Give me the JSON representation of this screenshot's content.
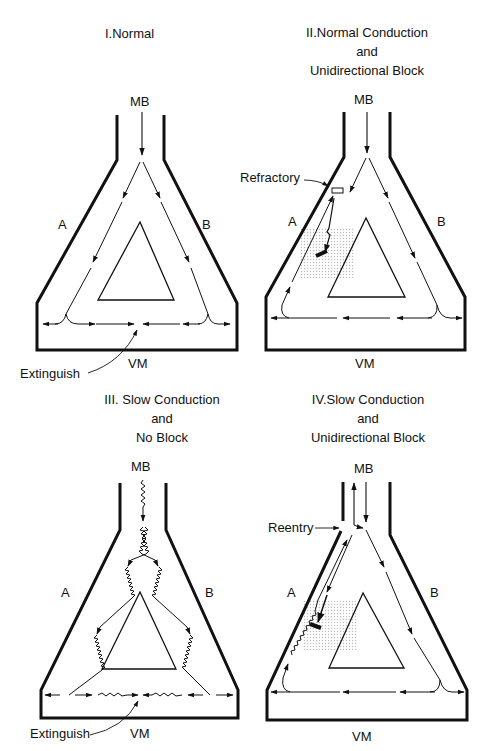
{
  "panels": [
    {
      "id": "I",
      "title_lines": [
        "I.Normal"
      ],
      "labels": {
        "top": "MB",
        "left": "A",
        "right": "B",
        "bottom": "VM",
        "annotation": "Extinguish"
      }
    },
    {
      "id": "II",
      "title_lines": [
        "II.Normal Conduction",
        "and",
        "Unidirectional Block"
      ],
      "labels": {
        "top": "MB",
        "left": "A",
        "right": "B",
        "bottom": "VM",
        "annotation": "Refractory"
      }
    },
    {
      "id": "III",
      "title_lines": [
        "III. Slow Conduction",
        "and",
        "No Block"
      ],
      "labels": {
        "top": "MB",
        "left": "A",
        "right": "B",
        "bottom": "VM",
        "annotation": "Extinguish"
      }
    },
    {
      "id": "IV",
      "title_lines": [
        "IV.Slow Conduction",
        "and",
        "Unidirectional Block"
      ],
      "labels": {
        "top": "MB",
        "left": "A",
        "right": "B",
        "bottom": "VM",
        "annotation": "Reentry"
      }
    }
  ]
}
